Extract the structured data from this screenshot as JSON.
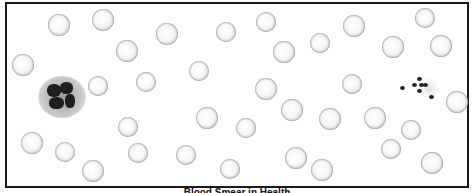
{
  "figure": {
    "caption": "Blood Smear in Health",
    "frame_color": "#1a1a1a",
    "cell_types": [
      "red-blood-cell",
      "white-blood-cell",
      "platelet"
    ],
    "red_blood_cells": [
      {
        "x": 59,
        "y": 25,
        "r": 11
      },
      {
        "x": 103,
        "y": 20,
        "r": 11
      },
      {
        "x": 127,
        "y": 51,
        "r": 11
      },
      {
        "x": 167,
        "y": 34,
        "r": 11
      },
      {
        "x": 226,
        "y": 32,
        "r": 10
      },
      {
        "x": 266,
        "y": 22,
        "r": 10
      },
      {
        "x": 284,
        "y": 52,
        "r": 11
      },
      {
        "x": 320,
        "y": 43,
        "r": 10
      },
      {
        "x": 354,
        "y": 26,
        "r": 11
      },
      {
        "x": 393,
        "y": 47,
        "r": 11
      },
      {
        "x": 425,
        "y": 18,
        "r": 10
      },
      {
        "x": 441,
        "y": 46,
        "r": 11
      },
      {
        "x": 23,
        "y": 65,
        "r": 11
      },
      {
        "x": 98,
        "y": 86,
        "r": 10
      },
      {
        "x": 146,
        "y": 82,
        "r": 10
      },
      {
        "x": 199,
        "y": 71,
        "r": 10
      },
      {
        "x": 266,
        "y": 89,
        "r": 11
      },
      {
        "x": 292,
        "y": 110,
        "r": 11
      },
      {
        "x": 352,
        "y": 84,
        "r": 10
      },
      {
        "x": 457,
        "y": 102,
        "r": 11
      },
      {
        "x": 128,
        "y": 127,
        "r": 10
      },
      {
        "x": 207,
        "y": 118,
        "r": 11
      },
      {
        "x": 246,
        "y": 128,
        "r": 10
      },
      {
        "x": 330,
        "y": 119,
        "r": 11
      },
      {
        "x": 375,
        "y": 118,
        "r": 11
      },
      {
        "x": 411,
        "y": 130,
        "r": 10
      },
      {
        "x": 32,
        "y": 143,
        "r": 11
      },
      {
        "x": 65,
        "y": 152,
        "r": 10
      },
      {
        "x": 93,
        "y": 171,
        "r": 11
      },
      {
        "x": 138,
        "y": 153,
        "r": 10
      },
      {
        "x": 186,
        "y": 155,
        "r": 10
      },
      {
        "x": 230,
        "y": 169,
        "r": 10
      },
      {
        "x": 296,
        "y": 158,
        "r": 11
      },
      {
        "x": 322,
        "y": 170,
        "r": 11
      },
      {
        "x": 391,
        "y": 149,
        "r": 10
      },
      {
        "x": 432,
        "y": 163,
        "r": 11
      }
    ],
    "white_blood_cell": {
      "x": 62,
      "y": 97,
      "label": "neutrophil"
    },
    "platelets": [
      {
        "x": 419,
        "y": 79
      },
      {
        "x": 414,
        "y": 85
      },
      {
        "x": 421,
        "y": 85
      },
      {
        "x": 425,
        "y": 85
      },
      {
        "x": 419,
        "y": 91
      },
      {
        "x": 402,
        "y": 88
      },
      {
        "x": 431,
        "y": 97
      }
    ]
  }
}
